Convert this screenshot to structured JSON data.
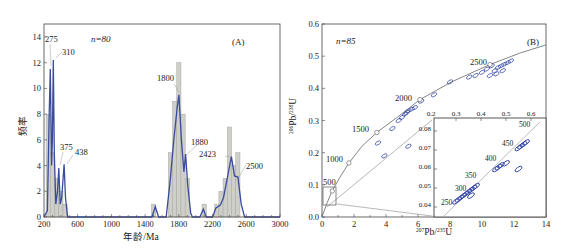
{
  "chart_data": [
    {
      "panel": "A",
      "type": "bar",
      "subtype": "histogram-with-probability-density-curve",
      "title": "",
      "panel_label": "(A)",
      "annotation_n": "n=80",
      "xlabel": "年龄/Ma",
      "ylabel": "频率",
      "xlim": [
        200,
        3000
      ],
      "ylim": [
        0,
        14
      ],
      "xticks": [
        200,
        600,
        1000,
        1400,
        1800,
        2200,
        2600,
        3000
      ],
      "yticks": [
        0,
        2,
        4,
        6,
        8,
        10,
        12,
        14
      ],
      "bin_width": 50,
      "bars": [
        {
          "x": 250,
          "count": 8
        },
        {
          "x": 300,
          "count": 5
        },
        {
          "x": 350,
          "count": 3
        },
        {
          "x": 400,
          "count": 2
        },
        {
          "x": 450,
          "count": 1
        },
        {
          "x": 1500,
          "count": 1
        },
        {
          "x": 1700,
          "count": 5
        },
        {
          "x": 1750,
          "count": 9
        },
        {
          "x": 1800,
          "count": 12
        },
        {
          "x": 1850,
          "count": 8
        },
        {
          "x": 1900,
          "count": 3
        },
        {
          "x": 2100,
          "count": 1
        },
        {
          "x": 2250,
          "count": 1
        },
        {
          "x": 2300,
          "count": 2
        },
        {
          "x": 2350,
          "count": 3
        },
        {
          "x": 2400,
          "count": 7
        },
        {
          "x": 2450,
          "count": 4
        },
        {
          "x": 2500,
          "count": 5
        }
      ],
      "density_curve": [
        [
          200,
          0
        ],
        [
          240,
          0.5
        ],
        [
          262,
          8
        ],
        [
          275,
          11.5
        ],
        [
          290,
          4
        ],
        [
          300,
          6
        ],
        [
          310,
          12.2
        ],
        [
          322,
          5
        ],
        [
          340,
          1
        ],
        [
          360,
          2
        ],
        [
          375,
          3.8
        ],
        [
          392,
          1
        ],
        [
          410,
          1.5
        ],
        [
          438,
          4.1
        ],
        [
          455,
          1.5
        ],
        [
          480,
          0
        ],
        [
          1480,
          0
        ],
        [
          1520,
          0.8
        ],
        [
          1560,
          0
        ],
        [
          1650,
          0
        ],
        [
          1700,
          3
        ],
        [
          1740,
          6
        ],
        [
          1780,
          8.5
        ],
        [
          1800,
          9.5
        ],
        [
          1830,
          6
        ],
        [
          1860,
          3.5
        ],
        [
          1880,
          4.9
        ],
        [
          1905,
          2.5
        ],
        [
          1940,
          0.3
        ],
        [
          1960,
          0
        ],
        [
          2050,
          0
        ],
        [
          2090,
          0.6
        ],
        [
          2125,
          0
        ],
        [
          2200,
          0
        ],
        [
          2240,
          0.7
        ],
        [
          2290,
          0.9
        ],
        [
          2330,
          1.5
        ],
        [
          2380,
          3.2
        ],
        [
          2423,
          4.7
        ],
        [
          2460,
          3.2
        ],
        [
          2500,
          3.1
        ],
        [
          2540,
          1
        ],
        [
          2580,
          0
        ],
        [
          3000,
          0
        ]
      ],
      "series": [
        {
          "name": "Histogram (frequency)",
          "color": "#c8c8c2"
        },
        {
          "name": "Relative probability density",
          "color": "#3a4b9e"
        }
      ],
      "peak_labels": [
        {
          "text": "275",
          "x": 275
        },
        {
          "text": "310",
          "x": 310
        },
        {
          "text": "375",
          "x": 375
        },
        {
          "text": "438",
          "x": 438
        },
        {
          "text": "1800",
          "x": 1800
        },
        {
          "text": "1880",
          "x": 1880
        },
        {
          "text": "2423",
          "x": 2423
        },
        {
          "text": "2500",
          "x": 2500
        }
      ],
      "grid": false,
      "legend": "none"
    },
    {
      "panel": "B",
      "type": "scatter",
      "subtype": "U-Pb concordia diagram with inset",
      "title": "",
      "panel_label": "(B)",
      "annotation_n": "n=85",
      "xlabel": "207Pb/235U",
      "ylabel": "206Pb/238U",
      "xlim": [
        0,
        14
      ],
      "ylim": [
        0.0,
        0.6
      ],
      "xticks": [
        0,
        2,
        4,
        6,
        8,
        10,
        12,
        14
      ],
      "yticks": [
        0.0,
        0.1,
        0.2,
        0.3,
        0.4,
        0.5,
        0.6
      ],
      "concordia_age_labels": [
        {
          "text": "500",
          "x": 0.64,
          "y": 0.081
        },
        {
          "text": "1000",
          "x": 1.68,
          "y": 0.168
        },
        {
          "text": "1500",
          "x": 3.43,
          "y": 0.263
        },
        {
          "text": "2000",
          "x": 6.12,
          "y": 0.365
        },
        {
          "text": "2500",
          "x": 10.5,
          "y": 0.474
        }
      ],
      "concordia_curve": [
        [
          0,
          0
        ],
        [
          0.32,
          0.044
        ],
        [
          0.64,
          0.081
        ],
        [
          1.1,
          0.122
        ],
        [
          1.68,
          0.168
        ],
        [
          2.5,
          0.22
        ],
        [
          3.43,
          0.263
        ],
        [
          4.7,
          0.31
        ],
        [
          6.12,
          0.365
        ],
        [
          8.1,
          0.42
        ],
        [
          10.5,
          0.474
        ],
        [
          12.4,
          0.51
        ],
        [
          14,
          0.535
        ]
      ],
      "discordia_line": [
        [
          0,
          0.03
        ],
        [
          7,
          0.3
        ]
      ],
      "ellipses_main": [
        [
          3.5,
          0.23
        ],
        [
          3.9,
          0.19
        ],
        [
          4.4,
          0.275
        ],
        [
          5.4,
          0.22
        ],
        [
          4.8,
          0.3
        ],
        [
          5.0,
          0.31
        ],
        [
          5.2,
          0.32
        ],
        [
          5.4,
          0.33
        ],
        [
          5.6,
          0.335
        ],
        [
          5.8,
          0.34
        ],
        [
          5.3,
          0.325
        ],
        [
          6.2,
          0.36
        ],
        [
          7.0,
          0.38
        ],
        [
          8.0,
          0.42
        ],
        [
          9.2,
          0.435
        ],
        [
          9.6,
          0.44
        ],
        [
          10.0,
          0.45
        ],
        [
          10.3,
          0.46
        ],
        [
          10.6,
          0.47
        ],
        [
          10.8,
          0.455
        ],
        [
          11.0,
          0.465
        ],
        [
          11.2,
          0.47
        ],
        [
          11.4,
          0.475
        ],
        [
          10.5,
          0.44
        ],
        [
          10.9,
          0.445
        ],
        [
          11.3,
          0.455
        ],
        [
          11.6,
          0.48
        ],
        [
          11.8,
          0.485
        ]
      ],
      "inset": {
        "xlim": [
          0.2,
          0.65
        ],
        "ylim": [
          0.035,
          0.083
        ],
        "xticks_top": [
          0.2,
          0.3,
          0.4,
          0.5,
          0.6
        ],
        "yticks": [
          0.04,
          0.05,
          0.06,
          0.07,
          0.08
        ],
        "age_labels": [
          "250",
          "300",
          "350",
          "400",
          "450",
          "500"
        ],
        "ellipses": [
          [
            0.3,
            0.043
          ],
          [
            0.31,
            0.044
          ],
          [
            0.32,
            0.045
          ],
          [
            0.33,
            0.046
          ],
          [
            0.34,
            0.047
          ],
          [
            0.35,
            0.048
          ],
          [
            0.36,
            0.049
          ],
          [
            0.37,
            0.05
          ],
          [
            0.38,
            0.051
          ],
          [
            0.36,
            0.046
          ],
          [
            0.46,
            0.06
          ],
          [
            0.47,
            0.061
          ],
          [
            0.48,
            0.062
          ],
          [
            0.5,
            0.063
          ],
          [
            0.55,
            0.071
          ],
          [
            0.56,
            0.072
          ],
          [
            0.57,
            0.073
          ],
          [
            0.58,
            0.074
          ],
          [
            0.55,
            0.06
          ]
        ]
      },
      "zoom_box": {
        "x": [
          0.05,
          0.85
        ],
        "y": [
          0.035,
          0.092
        ]
      },
      "grid": false,
      "legend": "none"
    }
  ],
  "ui": {
    "panelA": {
      "label": "(A)",
      "n": "n=80",
      "xlabel": "年龄/Ma",
      "ylabel": "频率",
      "xticks": [
        "200",
        "600",
        "1000",
        "1400",
        "1800",
        "2200",
        "2600",
        "3000"
      ],
      "yticks": [
        "0",
        "2",
        "4",
        "6",
        "8",
        "10",
        "12",
        "14"
      ],
      "peaks": [
        "275",
        "310",
        "375",
        "438",
        "1800",
        "1880",
        "2423",
        "2500"
      ]
    },
    "panelB": {
      "label": "(B)",
      "n": "n=85",
      "xlabel_sup": "207",
      "xlabel_main": "Pb/",
      "xlabel_sup2": "235",
      "xlabel_end": "U",
      "ylabel_sup": "206",
      "ylabel_main": "Pb/",
      "ylabel_sup2": "238",
      "ylabel_end": "U",
      "xticks": [
        "0",
        "2",
        "4",
        "6",
        "8",
        "10",
        "12",
        "14"
      ],
      "yticks": [
        "0.0",
        "0.1",
        "0.2",
        "0.3",
        "0.4",
        "0.5",
        "0.6"
      ],
      "ages": [
        "500",
        "1000",
        "1500",
        "2000",
        "2500"
      ],
      "inset_xticks": [
        "0.2",
        "0.3",
        "0.4",
        "0.5",
        "0.6"
      ],
      "inset_yticks": [
        "0.08",
        "0.07",
        "0.06",
        "0.05",
        "0.04"
      ],
      "inset_ages": [
        "250",
        "300",
        "350",
        "400",
        "450",
        "500"
      ]
    },
    "colors": {
      "bar_fill": "#cfcfca",
      "bar_stroke": "#a8a8a2",
      "curve": "#3a4b9e",
      "curve_fill": "#5a6ab8",
      "ellipse": "#3346a8",
      "concordia": "#777777",
      "axis": "#333333"
    }
  }
}
